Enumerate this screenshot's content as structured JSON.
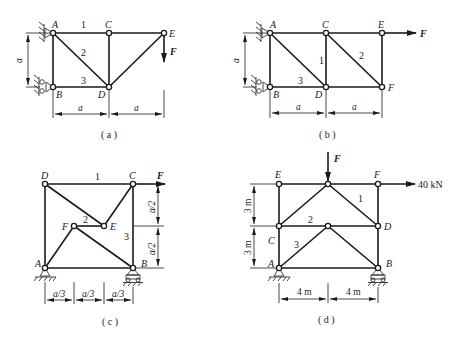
{
  "figures": [
    {
      "id": "a",
      "caption": "( a )",
      "nodes": {
        "A": "A",
        "B": "B",
        "C": "C",
        "D": "D",
        "E": "E"
      },
      "members": {
        "m1": "1",
        "m2": "2",
        "m3": "3"
      },
      "dimensions": {
        "height": "a",
        "width1": "a",
        "width2": "a"
      },
      "load": {
        "label": "F",
        "direction": "down",
        "at": "E"
      }
    },
    {
      "id": "b",
      "caption": "( b )",
      "nodes": {
        "A": "A",
        "B": "B",
        "C": "C",
        "D": "D",
        "E": "E",
        "F": "F"
      },
      "members": {
        "m1": "1",
        "m2": "2",
        "m3": "3"
      },
      "dimensions": {
        "height": "a",
        "width1": "a",
        "width2": "a"
      },
      "load": {
        "label": "F",
        "direction": "right",
        "at": "E"
      }
    },
    {
      "id": "c",
      "caption": "( c )",
      "nodes": {
        "A": "A",
        "B": "B",
        "C": "C",
        "D": "D",
        "E": "E",
        "F": "F"
      },
      "members": {
        "m1": "1",
        "m2": "2",
        "m3": "3"
      },
      "dimensions": {
        "h1": "a/2",
        "h2": "a/2",
        "w1": "a/3",
        "w2": "a/3",
        "w3": "a/3"
      },
      "load": {
        "label": "F",
        "direction": "right",
        "at": "C"
      }
    },
    {
      "id": "d",
      "caption": "( d )",
      "nodes": {
        "A": "A",
        "B": "B",
        "C": "C",
        "D": "D",
        "E": "E",
        "F": "F"
      },
      "members": {
        "m1": "1",
        "m2": "2",
        "m3": "3"
      },
      "dimensions": {
        "h1": "3 m",
        "h2": "3 m",
        "w1": "4 m",
        "w2": "4 m"
      },
      "load_vertical": {
        "label": "F",
        "direction": "down",
        "at": "top-middle"
      },
      "load_horizontal": {
        "label": "40 kN",
        "direction": "right",
        "at": "F"
      }
    }
  ]
}
